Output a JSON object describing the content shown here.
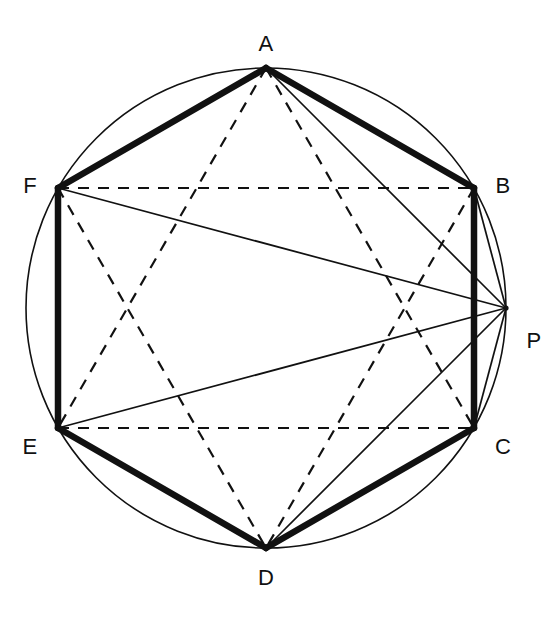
{
  "figure": {
    "canvas": {
      "width": 554,
      "height": 619,
      "background": "#ffffff"
    },
    "circle": {
      "name": "circumcircle",
      "cx": 266,
      "cy": 308,
      "r": 240,
      "stroke": "#111111",
      "stroke_width": 1.6,
      "fill": "none"
    },
    "styles": {
      "thick_stroke": "#111111",
      "thick_width": 6.5,
      "thin_stroke": "#111111",
      "thin_width": 1.7,
      "dashed_stroke": "#111111",
      "dashed_width": 2.2,
      "dash_pattern": "11,9"
    },
    "points": [
      {
        "id": "A",
        "label": "A",
        "x": 266,
        "y": 68,
        "angle_deg": 90,
        "label_x": 266,
        "label_y": 44,
        "on_circle": true
      },
      {
        "id": "B",
        "label": "B",
        "x": 474,
        "y": 188,
        "angle_deg": 30,
        "label_x": 503,
        "label_y": 186,
        "on_circle": true
      },
      {
        "id": "C",
        "label": "C",
        "x": 474,
        "y": 428,
        "angle_deg": -30,
        "label_x": 503,
        "label_y": 447,
        "on_circle": true
      },
      {
        "id": "D",
        "label": "D",
        "x": 266,
        "y": 548,
        "angle_deg": -90,
        "label_x": 266,
        "label_y": 578,
        "on_circle": true
      },
      {
        "id": "E",
        "label": "E",
        "x": 58,
        "y": 428,
        "angle_deg": 210,
        "label_x": 30,
        "label_y": 447,
        "on_circle": true
      },
      {
        "id": "F",
        "label": "F",
        "x": 58,
        "y": 188,
        "angle_deg": 150,
        "label_x": 30,
        "label_y": 186,
        "on_circle": true
      },
      {
        "id": "P",
        "label": "P",
        "x": 506,
        "y": 308,
        "angle_deg": 0,
        "label_x": 534,
        "label_y": 341,
        "on_circle": true
      }
    ],
    "hexagon_edges": [
      {
        "name": "edge-AB",
        "from": "A",
        "to": "B",
        "style": "thick"
      },
      {
        "name": "edge-BC",
        "from": "B",
        "to": "C",
        "style": "thick"
      },
      {
        "name": "edge-CD",
        "from": "C",
        "to": "D",
        "style": "thick"
      },
      {
        "name": "edge-DE",
        "from": "D",
        "to": "E",
        "style": "thick"
      },
      {
        "name": "edge-EF",
        "from": "E",
        "to": "F",
        "style": "thick"
      },
      {
        "name": "edge-FA",
        "from": "F",
        "to": "A",
        "style": "thick"
      }
    ],
    "dashed_chords": [
      {
        "name": "chord-FB",
        "from": "F",
        "to": "B",
        "style": "dashed"
      },
      {
        "name": "chord-EC",
        "from": "E",
        "to": "C",
        "style": "dashed"
      },
      {
        "name": "chord-AE",
        "from": "A",
        "to": "E",
        "style": "dashed"
      },
      {
        "name": "chord-AC",
        "from": "A",
        "to": "C",
        "style": "dashed"
      },
      {
        "name": "chord-FD",
        "from": "F",
        "to": "D",
        "style": "dashed"
      },
      {
        "name": "chord-BD",
        "from": "B",
        "to": "D",
        "style": "dashed"
      }
    ],
    "p_rays": [
      {
        "name": "ray-PA",
        "from": "P",
        "to": "A",
        "style": "thin"
      },
      {
        "name": "ray-PB",
        "from": "P",
        "to": "B",
        "style": "thin"
      },
      {
        "name": "ray-PC",
        "from": "P",
        "to": "C",
        "style": "thin"
      },
      {
        "name": "ray-PD",
        "from": "P",
        "to": "D",
        "style": "thin"
      },
      {
        "name": "ray-PE",
        "from": "P",
        "to": "E",
        "style": "thin"
      },
      {
        "name": "ray-PF",
        "from": "P",
        "to": "F",
        "style": "thin"
      }
    ]
  }
}
